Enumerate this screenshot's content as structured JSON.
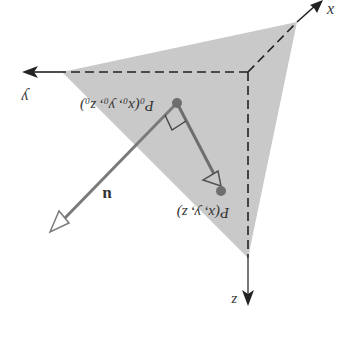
{
  "diagram": {
    "orientation": "rotated 180 degrees",
    "axes": {
      "x": {
        "label": "x"
      },
      "y": {
        "label": "y"
      },
      "z": {
        "label": "z"
      }
    },
    "points": {
      "p0": {
        "label": "P₀(x₀, y₀, z₀)"
      },
      "p": {
        "label": "P(x, y, z)"
      }
    },
    "vector": {
      "label": "u"
    },
    "colors": {
      "plane_fill": "#c9c9c9",
      "axis_line": "#222222",
      "vector_line": "#7a7a7a",
      "point_fill": "#6e6e6e",
      "text": "#333333"
    }
  }
}
